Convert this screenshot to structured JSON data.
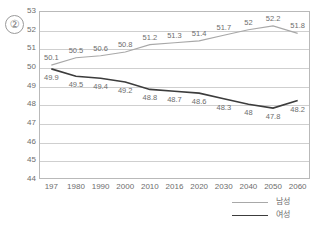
{
  "figure_marker": "②",
  "legend": {
    "position": "bottom-right",
    "entries": [
      {
        "label": "남성",
        "color": "#a8a8a8",
        "name": "legend-item-male"
      },
      {
        "label": "여성",
        "color": "#3c3c3c",
        "name": "legend-item-female"
      }
    ]
  },
  "chart_data": {
    "type": "line",
    "title": "",
    "xlabel": "",
    "ylabel": "",
    "categories": [
      "197",
      "1980",
      "1990",
      "2000",
      "2010",
      "2016",
      "2020",
      "2030",
      "2040",
      "2050",
      "2060"
    ],
    "ylim": [
      44,
      53
    ],
    "yticks": [
      44,
      45,
      46,
      47,
      48,
      49,
      50,
      51,
      52,
      53
    ],
    "grid": true,
    "series": [
      {
        "name": "남성",
        "color": "#a8a8a8",
        "values": [
          50.1,
          50.5,
          50.6,
          50.8,
          51.2,
          51.3,
          51.4,
          51.7,
          52,
          52.2,
          51.8
        ],
        "labels": [
          "50.1",
          "50.5",
          "50.6",
          "50.8",
          "51.2",
          "51.3",
          "51.4",
          "51.7",
          "52",
          "52.2",
          "51.8"
        ]
      },
      {
        "name": "여성",
        "color": "#3c3c3c",
        "values": [
          49.9,
          49.5,
          49.4,
          49.2,
          48.8,
          48.7,
          48.6,
          48.3,
          48,
          47.8,
          48.2
        ],
        "labels": [
          "49.9",
          "49.5",
          "49.4",
          "49.2",
          "48.8",
          "48.7",
          "48.6",
          "48.3",
          "48",
          "47.8",
          "48.2"
        ]
      }
    ]
  }
}
